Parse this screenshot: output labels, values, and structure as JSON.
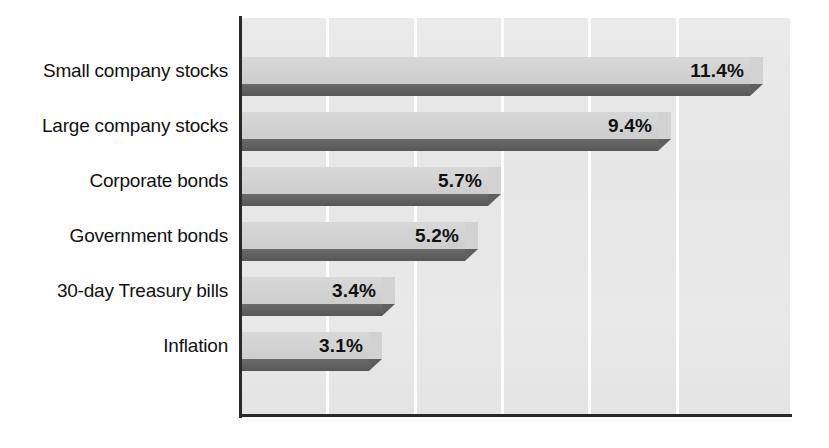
{
  "chart_data": {
    "type": "bar",
    "orientation": "horizontal",
    "title": "",
    "subtitle": "",
    "xlabel": "",
    "ylabel": "",
    "categories": [
      "Small company stocks",
      "Large company stocks",
      "Corporate bonds",
      "Government bonds",
      "30-day Treasury bills",
      "Inflation"
    ],
    "values": [
      11.4,
      9.4,
      5.7,
      5.2,
      3.4,
      3.1
    ],
    "value_labels": [
      "11.4%",
      "9.4%",
      "5.7%",
      "5.2%",
      "3.4%",
      "3.1%"
    ],
    "unit": "%",
    "xlim": [
      0,
      12
    ],
    "gridlines": [
      1.9,
      3.8,
      5.7,
      7.6,
      9.5
    ],
    "grid": true,
    "grid_orientation": "vertical",
    "tick_labels": [],
    "legend": [],
    "legend_position": "none",
    "annotations": [],
    "colors": {
      "bar_face": "#d2d2d2",
      "bar_shadow": "#5f5f5f",
      "plot_background": "#e9e9e9",
      "gridline": "#fdfdfd",
      "axis": "#2a2a2a",
      "label_text": "#111111",
      "page_background": "#ffffff"
    }
  },
  "geometry": {
    "plot_left": 239,
    "plot_top": 18,
    "plot_width": 551,
    "plot_height": 398,
    "px_per_unit": 46.0,
    "row_centers": [
      70,
      125,
      180,
      235,
      290,
      345
    ],
    "bar_top_height": 27,
    "bar_side_height": 12,
    "gridline_x": [
      326,
      414,
      501,
      588,
      676
    ]
  }
}
